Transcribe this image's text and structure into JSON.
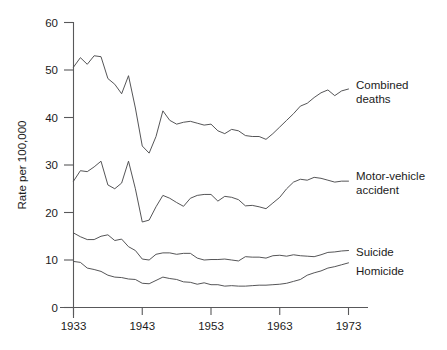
{
  "chart_data": {
    "type": "line",
    "title": "",
    "subtitle": "",
    "xlabel": "",
    "ylabel": "Rate per 100,000",
    "xlim": [
      1933,
      1973
    ],
    "ylim": [
      0,
      60
    ],
    "grid": false,
    "legend_position": "right-inline-labels",
    "x_ticks": [
      "1933",
      "1943",
      "1953",
      "1963",
      "1973"
    ],
    "x_tick_values": [
      1933,
      1943,
      1953,
      1963,
      1973
    ],
    "y_ticks": [
      "0",
      "10",
      "20",
      "30",
      "40",
      "50",
      "60"
    ],
    "y_tick_values": [
      0,
      10,
      20,
      30,
      40,
      50,
      60
    ],
    "x": [
      1933,
      1934,
      1935,
      1936,
      1937,
      1938,
      1939,
      1940,
      1941,
      1942,
      1943,
      1944,
      1945,
      1946,
      1947,
      1948,
      1949,
      1950,
      1951,
      1952,
      1953,
      1954,
      1955,
      1956,
      1957,
      1958,
      1959,
      1960,
      1961,
      1962,
      1963,
      1964,
      1965,
      1966,
      1967,
      1968,
      1969,
      1970,
      1971,
      1972,
      1973
    ],
    "series": [
      {
        "name": "Combined deaths",
        "label": "Combined\ndeaths",
        "values": [
          50.6,
          52.6,
          51.2,
          53.0,
          52.8,
          48.2,
          47.0,
          45.0,
          48.8,
          42.0,
          34.0,
          32.5,
          36.0,
          41.4,
          39.4,
          38.6,
          39.0,
          39.2,
          38.8,
          38.4,
          38.6,
          37.2,
          36.6,
          37.5,
          37.2,
          36.2,
          36.0,
          36.0,
          35.4,
          36.6,
          38.0,
          39.4,
          40.8,
          42.4,
          43.0,
          44.2,
          45.2,
          45.8,
          44.6,
          45.6,
          46.0
        ]
      },
      {
        "name": "Motor-vehicle accident",
        "label": "Motor-vehicle\naccident",
        "values": [
          26.6,
          28.8,
          28.6,
          29.6,
          30.8,
          25.8,
          25.0,
          26.2,
          30.8,
          25.0,
          18.0,
          18.4,
          21.2,
          23.6,
          23.0,
          22.1,
          21.3,
          23.0,
          23.6,
          23.8,
          23.8,
          22.4,
          23.4,
          23.2,
          22.7,
          21.4,
          21.5,
          21.2,
          20.8,
          22.0,
          23.2,
          25.0,
          26.4,
          27.0,
          26.8,
          27.4,
          27.2,
          26.8,
          26.4,
          26.6,
          26.6
        ]
      },
      {
        "name": "Suicide",
        "label": "Suicide",
        "values": [
          15.7,
          14.9,
          14.3,
          14.3,
          15.0,
          15.3,
          14.1,
          14.4,
          12.8,
          12.0,
          10.2,
          10.0,
          11.2,
          11.5,
          11.5,
          11.2,
          11.4,
          11.4,
          10.4,
          10.0,
          10.1,
          10.1,
          10.2,
          10.0,
          9.8,
          10.7,
          10.6,
          10.6,
          10.4,
          10.9,
          11.0,
          10.8,
          11.1,
          10.9,
          10.8,
          10.7,
          11.1,
          11.6,
          11.7,
          11.9,
          12.0
        ]
      },
      {
        "name": "Homicide",
        "label": "Homicide",
        "values": [
          9.7,
          9.5,
          8.3,
          8.0,
          7.6,
          6.8,
          6.4,
          6.3,
          6.0,
          5.9,
          5.1,
          5.0,
          5.7,
          6.4,
          6.1,
          5.9,
          5.4,
          5.3,
          4.9,
          5.2,
          4.8,
          4.8,
          4.5,
          4.6,
          4.5,
          4.5,
          4.6,
          4.7,
          4.7,
          4.8,
          4.9,
          5.1,
          5.5,
          5.9,
          6.8,
          7.3,
          7.7,
          8.3,
          8.6,
          9.0,
          9.4
        ]
      }
    ],
    "annotations": []
  },
  "labels": {
    "series_0": "Combined",
    "series_0_line2": "deaths",
    "series_1": "Motor-vehicle",
    "series_1_line2": "accident",
    "series_2": "Suicide",
    "series_3": "Homicide"
  },
  "style": {
    "line_color": "#4c4c4e",
    "axis_color": "#58585a",
    "text_color": "#1b1b1b",
    "background": "#ffffff"
  }
}
